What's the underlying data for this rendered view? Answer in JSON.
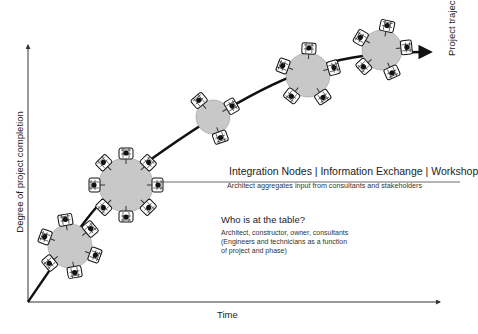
{
  "diagram": {
    "x_axis_label": "Time",
    "y_axis_label": "Degree of project completion",
    "trajectory_label": "Project trajectory",
    "callout": {
      "title": "Integration Nodes | Information Exchange | Workshop",
      "subtitle": "Architect aggregates input from consultants and stakeholders"
    },
    "question": {
      "title": "Who is at the table?",
      "lines": [
        "Architect, constructor, owner, consultants",
        "(Engineers and technicians as a function",
        "of project and phase)"
      ]
    },
    "nodes": [
      {
        "name": "node-1",
        "seats": 6
      },
      {
        "name": "node-2",
        "seats": 8
      },
      {
        "name": "node-3",
        "seats": 3
      },
      {
        "name": "node-4",
        "seats": 5
      },
      {
        "name": "node-5",
        "seats": 5
      }
    ],
    "colors": {
      "table": "#c8c8c8",
      "line": "#111111",
      "axis": "#333333"
    }
  }
}
